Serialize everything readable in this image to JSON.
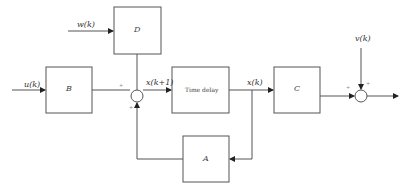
{
  "diagram": {
    "type": "block-diagram",
    "blocks": {
      "B": {
        "label": "B"
      },
      "D": {
        "label": "D"
      },
      "delay": {
        "label": "Time delay"
      },
      "C": {
        "label": "C"
      },
      "A": {
        "label": "A"
      }
    },
    "signals": {
      "u": "u(k)",
      "w": "w(k)",
      "x_next": "x(k+1)",
      "x": "x(k)",
      "v": "v(k)"
    },
    "signs": {
      "sum1_left": "+",
      "sum1_bottom": "+",
      "sum2_left": "+",
      "sum2_top": "+"
    },
    "colors": {
      "line": "#555555",
      "text": "#333333"
    }
  }
}
